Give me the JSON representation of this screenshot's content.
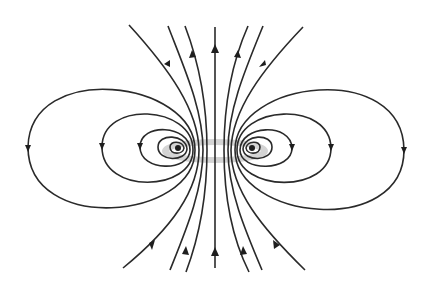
{
  "diagram": {
    "title": "",
    "colors": {
      "field_line": "#2a2a2a",
      "arrow": "#1e1e1e",
      "current_loop": "#d4d4d4",
      "background": "#ffffff"
    },
    "field_direction_center": "up",
    "closed_loop_count_per_side": 5,
    "open_line_count": 5,
    "labels": []
  }
}
